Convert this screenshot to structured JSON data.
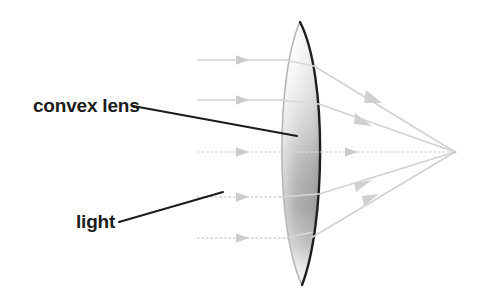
{
  "figure": {
    "background_color": "#ffffff"
  },
  "labels": [
    {
      "id": "convex-lens",
      "text": "convex lens",
      "x": 33,
      "y": 112,
      "leader_from": [
        133,
        106
      ],
      "leader_to": [
        297,
        136
      ],
      "color": "#1c1c1c"
    },
    {
      "id": "light",
      "text": "light",
      "x": 76,
      "y": 228,
      "leader_from": [
        119,
        222
      ],
      "leader_to": [
        223,
        192
      ],
      "color": "#1c1c1c"
    }
  ],
  "lens": {
    "name": "convex-lens-shape",
    "type": "biconvex",
    "top_tip": [
      300,
      22
    ],
    "bottom_tip": [
      302,
      285
    ],
    "left_edge_x": 283,
    "right_edge_x": 321,
    "center_y": 152,
    "outline_color_front": "#1a1a1a",
    "outline_color_back": "#b4b4b4",
    "fill_gradient": [
      "#ffffff",
      "#f2f2f2",
      "#c9c9c9",
      "#a0a0a0",
      "#ffffff"
    ]
  },
  "rays": {
    "color": "#cfcfcf",
    "axis_color": "#d8d8d8",
    "focal_point": [
      455,
      152
    ],
    "incoming": [
      {
        "id": "ray-1",
        "y": 60,
        "x_start": 197,
        "x_end": 300,
        "arrow_x": 242
      },
      {
        "id": "ray-2",
        "y": 100,
        "x_start": 197,
        "x_end": 292,
        "arrow_x": 242
      },
      {
        "id": "ray-3",
        "y": 152,
        "x_start": 197,
        "x_end": 288,
        "arrow_x": 242,
        "is_axis": true
      },
      {
        "id": "ray-4",
        "y": 197,
        "x_start": 197,
        "x_end": 292,
        "arrow_x": 242
      },
      {
        "id": "ray-5",
        "y": 238,
        "x_start": 197,
        "x_end": 300,
        "arrow_x": 242
      }
    ],
    "outgoing": [
      {
        "id": "ray-out-1",
        "from": [
          313,
          67
        ],
        "to": [
          455,
          152
        ],
        "arrow_t": 0.55
      },
      {
        "id": "ray-out-2",
        "from": [
          318,
          105
        ],
        "to": [
          455,
          152
        ],
        "arrow_t": 0.52
      },
      {
        "id": "ray-out-3",
        "from": [
          321,
          152
        ],
        "to": [
          455,
          152
        ],
        "arrow_t": 0.42,
        "is_axis": true
      },
      {
        "id": "ray-out-4",
        "from": [
          318,
          194
        ],
        "to": [
          455,
          152
        ],
        "arrow_t": 0.52
      },
      {
        "id": "ray-out-5",
        "from": [
          310,
          240
        ],
        "to": [
          455,
          152
        ],
        "arrow_t": 0.55
      }
    ]
  }
}
